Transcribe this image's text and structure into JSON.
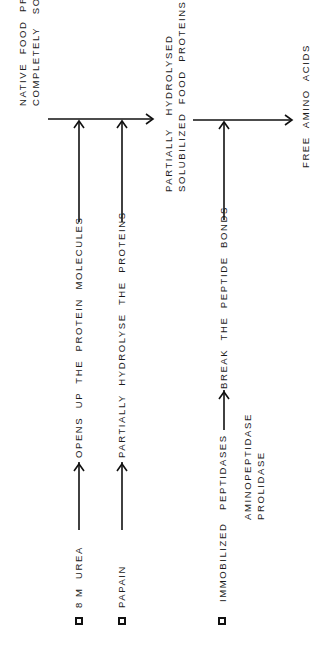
{
  "diagram": {
    "type": "process-flow",
    "orientation": "rotated-90-ccw",
    "states": [
      {
        "id": "native",
        "lines": [
          "NATIVE  FOOD  PROTEINS  NOT",
          "COMPLETELY   SOLUBLE"
        ]
      },
      {
        "id": "partial",
        "lines": [
          "PARTIALLY   HYDROLYSED",
          "SOLUBILIZED  FOOD  PROTEINS"
        ]
      },
      {
        "id": "free",
        "lines": [
          "FREE  AMINO  ACIDS"
        ]
      }
    ],
    "agents": [
      {
        "id": "urea",
        "label": "8 M  UREA",
        "effect": "OPENS  UP  THE  PROTEIN  MOLECULES"
      },
      {
        "id": "papain",
        "label": "PAPAIN",
        "effect": "PARTIALLY  HYDROLYSE  THE  PROTEINS"
      },
      {
        "id": "peptidases",
        "label": "IMMOBILIZED   PEPTIDASES",
        "sub": [
          "AMINOPEPTIDASE",
          "PROLIDASE"
        ],
        "effect": "BREAK  THE  PEPTIDE  BONDS"
      }
    ],
    "icons": {
      "checkbox": "square-outline-icon",
      "arrow": "arrow-icon"
    },
    "colors": {
      "ink": "#111111",
      "background": "#ffffff"
    }
  }
}
